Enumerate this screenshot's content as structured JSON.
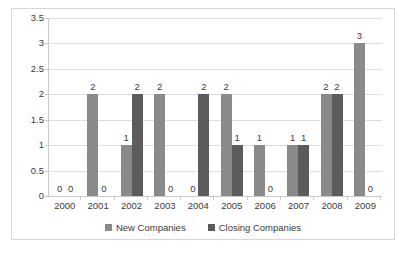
{
  "chart_data": {
    "type": "bar",
    "title": "",
    "xlabel": "",
    "ylabel": "",
    "ylim": [
      0,
      3.5
    ],
    "yticks": [
      "0",
      "0.5",
      "1",
      "1.5",
      "2",
      "2.5",
      "3",
      "3.5"
    ],
    "grid": true,
    "legend_position": "bottom",
    "categories": [
      "2000",
      "2001",
      "2002",
      "2003",
      "2004",
      "2005",
      "2006",
      "2007",
      "2008",
      "2009"
    ],
    "series": [
      {
        "name": "New Companies",
        "color": "#8a8a8a",
        "values": [
          0,
          2,
          1,
          2,
          0,
          2,
          1,
          1,
          2,
          3
        ]
      },
      {
        "name": "Closing Companies",
        "color": "#5c5c5c",
        "values": [
          0,
          0,
          2,
          0,
          2,
          1,
          0,
          1,
          2,
          0
        ]
      }
    ],
    "data_labels": [
      [
        "0",
        "0"
      ],
      [
        "2",
        "0"
      ],
      [
        "1",
        "2"
      ],
      [
        "2",
        "0"
      ],
      [
        "0",
        "2"
      ],
      [
        "2",
        "1"
      ],
      [
        "1",
        "0"
      ],
      [
        "1",
        "1"
      ],
      [
        "2",
        "2"
      ],
      [
        "3",
        "0"
      ]
    ]
  },
  "legend": {
    "entries": [
      {
        "label": "New Companies"
      },
      {
        "label": "Closing Companies"
      }
    ]
  }
}
